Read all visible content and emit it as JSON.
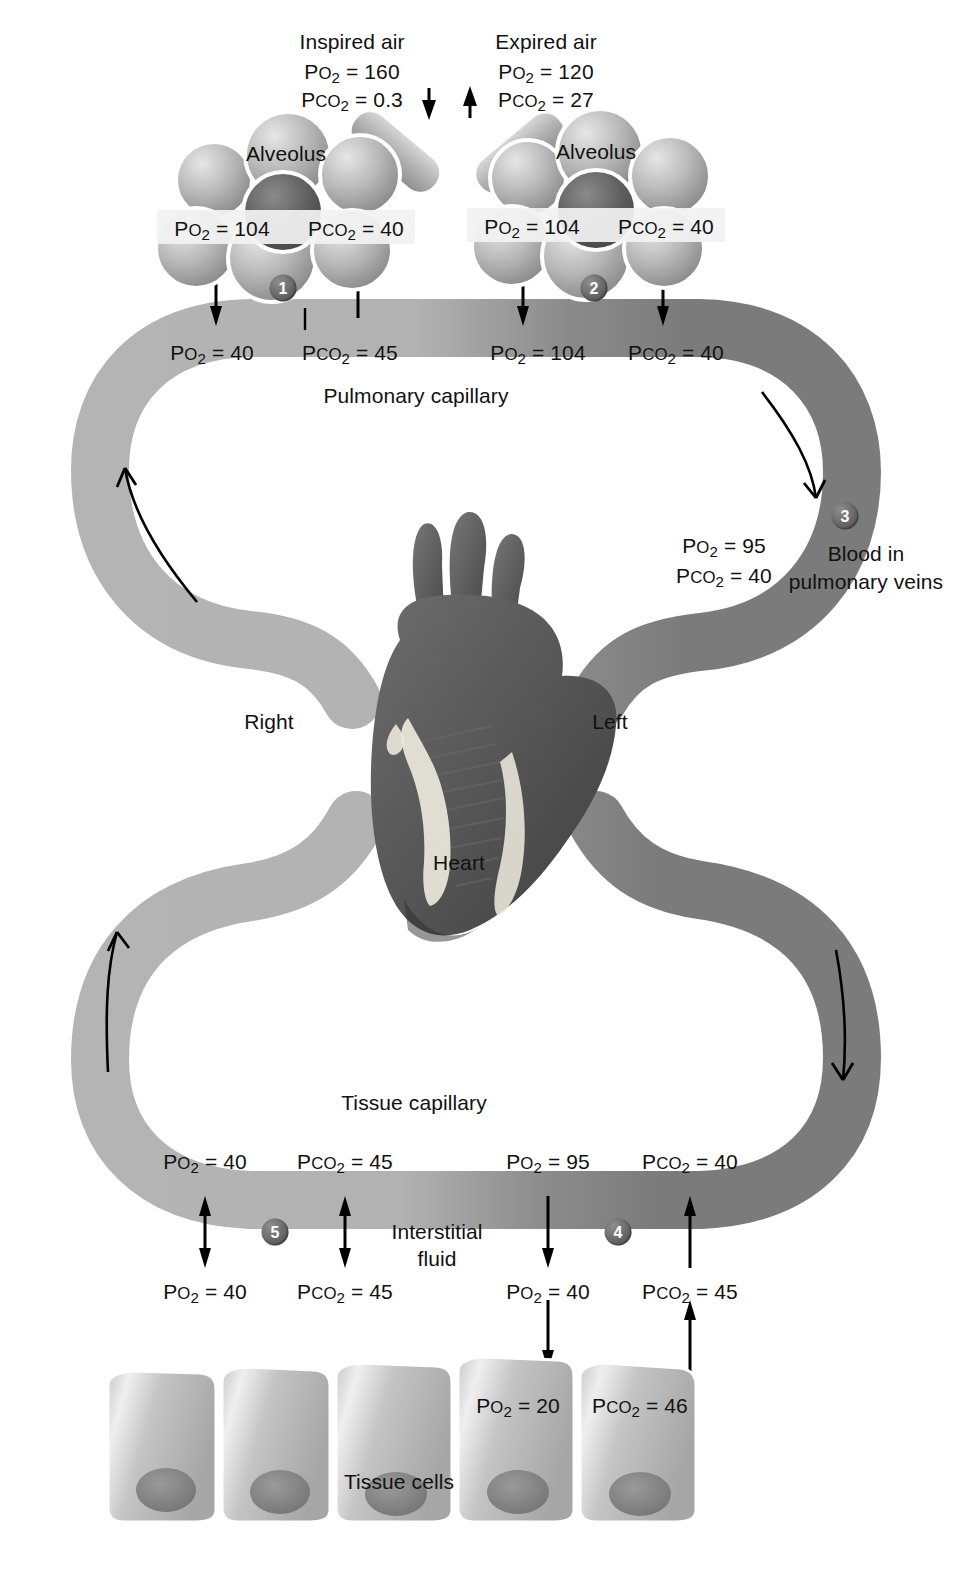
{
  "diagram": {
    "colors": {
      "deoxygenated_vessel": "#b4b4b4",
      "oxygenated_vessel": "#7b7b7b",
      "marker_fill": "#5d5d5d",
      "text": "#111111"
    }
  },
  "air": {
    "inspired": {
      "title": "Inspired air",
      "po2": "Pᴏ2 = 160",
      "pco2": "PᴏO2 = 0.3"
    },
    "expired": {
      "title": "Expired air",
      "po2": "Pᴏ2 = 120",
      "pco2": "PᴏO2 = 27"
    }
  },
  "alveoli": [
    {
      "label": "Alveolus",
      "po2": "Po2 = 104",
      "pco2": "Pco2 = 40",
      "marker": "1"
    },
    {
      "label": "Alveolus",
      "po2": "Po2 = 104",
      "pco2": "Pco2 = 40",
      "marker": "2"
    }
  ],
  "pulmonary_capillary": {
    "label": "Pulmonary capillary",
    "entering": {
      "po2": "Po2 = 40",
      "pco2": "Pco2 = 45"
    },
    "leaving": {
      "po2": "Po2 = 104",
      "pco2": "Pco2 = 40"
    }
  },
  "pulmonary_veins": {
    "marker": "3",
    "caption_line1": "Blood in",
    "caption_line2": "pulmonary veins",
    "po2": "Po2 = 95",
    "pco2": "Pco2 = 40"
  },
  "heart": {
    "label": "Heart",
    "side_right": "Right",
    "side_left": "Left"
  },
  "tissue_capillary": {
    "label": "Tissue capillary",
    "leaving": {
      "po2": "Po2 = 40",
      "pco2": "Pco2 = 45"
    },
    "entering": {
      "po2": "Po2 = 95",
      "pco2": "Pco2 = 40"
    }
  },
  "interstitial_fluid": {
    "label_line1": "Interstitial",
    "label_line2": "fluid",
    "marker_left": "5",
    "marker_right": "4",
    "left": {
      "po2": "Po2 = 40",
      "pco2": "Pco2 = 45"
    },
    "right": {
      "po2": "Po2 = 40",
      "pco2": "Pco2 = 45"
    }
  },
  "tissue_cells": {
    "label": "Tissue cells",
    "po2": "Po2 = 20",
    "pco2": "Pco2 = 46"
  }
}
